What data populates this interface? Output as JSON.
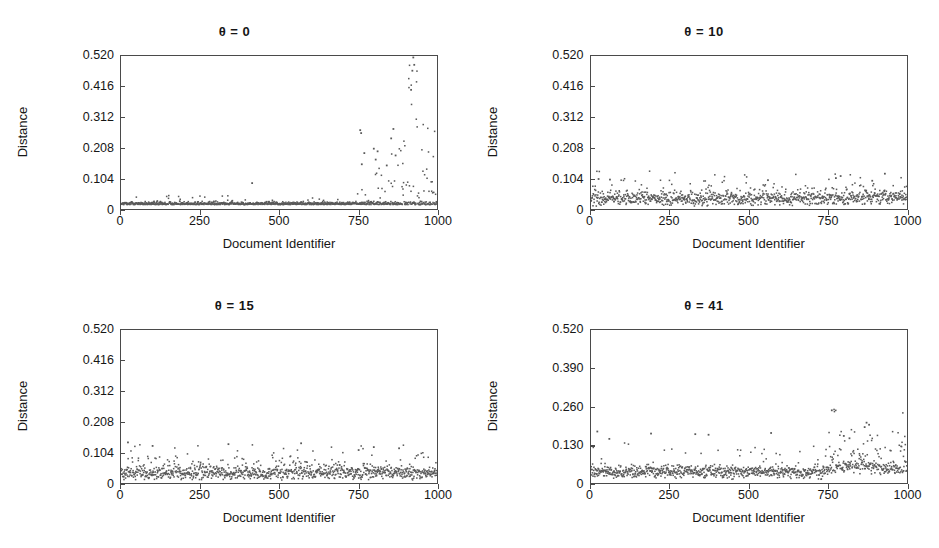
{
  "figure": {
    "background": "#ffffff",
    "point_color": "#5a5a5a",
    "axis_color": "#4a4a4a"
  },
  "chart_data": [
    {
      "type": "scatter",
      "title": "θ = 0",
      "xlabel": "Document Identifier",
      "ylabel": "Distance",
      "xlim": [
        0,
        1000
      ],
      "ylim": [
        0,
        0.52
      ],
      "xticks": [
        0,
        250,
        500,
        750,
        1000
      ],
      "xticklabels": [
        "0",
        "250",
        "500",
        "750",
        "1000"
      ],
      "yticks": [
        0,
        0.104,
        0.208,
        0.312,
        0.416,
        0.52
      ],
      "yticklabels": [
        "0",
        "0.104",
        "0.208",
        "0.312",
        "0.416",
        "0.520"
      ],
      "grid": false,
      "legend": "none",
      "n_points": 1000,
      "description": "Very tight low baseline band near 0.010-0.025 across all document identifiers, with a dramatic burst of high outliers from about x=740 to x=1000 reaching 0.52.",
      "baseline": {
        "mean": 0.015,
        "spread": 0.008
      },
      "outlier_region": {
        "start": 740,
        "end": 1000,
        "max": 0.52
      },
      "notable_outliers": [
        {
          "x": 925,
          "y": 0.515
        },
        {
          "x": 928,
          "y": 0.49
        },
        {
          "x": 922,
          "y": 0.47
        },
        {
          "x": 918,
          "y": 0.405
        },
        {
          "x": 757,
          "y": 0.268
        },
        {
          "x": 760,
          "y": 0.258
        },
        {
          "x": 862,
          "y": 0.272
        },
        {
          "x": 855,
          "y": 0.24
        },
        {
          "x": 800,
          "y": 0.205
        },
        {
          "x": 812,
          "y": 0.196
        },
        {
          "x": 770,
          "y": 0.19
        },
        {
          "x": 869,
          "y": 0.182
        },
        {
          "x": 806,
          "y": 0.168
        },
        {
          "x": 762,
          "y": 0.152
        },
        {
          "x": 841,
          "y": 0.148
        },
        {
          "x": 415,
          "y": 0.088
        }
      ]
    },
    {
      "type": "scatter",
      "title": "θ = 10",
      "xlabel": "Document Identifier",
      "ylabel": "Distance",
      "xlim": [
        0,
        1000
      ],
      "ylim": [
        0,
        0.52
      ],
      "xticks": [
        0,
        250,
        500,
        750,
        1000
      ],
      "xticklabels": [
        "0",
        "250",
        "500",
        "750",
        "1000"
      ],
      "yticks": [
        0,
        0.104,
        0.208,
        0.312,
        0.416,
        0.52
      ],
      "yticklabels": [
        "0",
        "0.104",
        "0.208",
        "0.312",
        "0.416",
        "0.520"
      ],
      "grid": false,
      "legend": "none",
      "n_points": 1000,
      "description": "Uniform noisy band occupying roughly 0.010-0.090 across the full range of document identifiers, slightly denser and taller toward the right half. No extreme outliers.",
      "baseline": {
        "mean": 0.035,
        "spread": 0.022
      },
      "outlier_region": {
        "start": 0,
        "end": 1000,
        "max": 0.115
      },
      "notable_outliers": [
        {
          "x": 930,
          "y": 0.12
        },
        {
          "x": 790,
          "y": 0.112
        },
        {
          "x": 775,
          "y": 0.105
        },
        {
          "x": 24,
          "y": 0.102
        },
        {
          "x": 60,
          "y": 0.1
        },
        {
          "x": 560,
          "y": 0.098
        },
        {
          "x": 890,
          "y": 0.096
        }
      ]
    },
    {
      "type": "scatter",
      "title": "θ = 15",
      "xlabel": "Document Identifier",
      "ylabel": "Distance",
      "xlim": [
        0,
        1000
      ],
      "ylim": [
        0,
        0.52
      ],
      "xticks": [
        0,
        250,
        500,
        750,
        1000
      ],
      "xticklabels": [
        "0",
        "250",
        "500",
        "750",
        "1000"
      ],
      "yticks": [
        0,
        0.104,
        0.208,
        0.312,
        0.416,
        0.52
      ],
      "yticklabels": [
        "0",
        "0.104",
        "0.208",
        "0.312",
        "0.416",
        "0.520"
      ],
      "grid": false,
      "legend": "none",
      "n_points": 1000,
      "description": "Uniform noisy band from roughly 0.008 to 0.085 across the whole x range with scattered spikes up to about 0.14, evenly distributed.",
      "baseline": {
        "mean": 0.034,
        "spread": 0.021
      },
      "outlier_region": {
        "start": 0,
        "end": 1000,
        "max": 0.14
      },
      "notable_outliers": [
        {
          "x": 22,
          "y": 0.138
        },
        {
          "x": 340,
          "y": 0.132
        },
        {
          "x": 570,
          "y": 0.135
        },
        {
          "x": 100,
          "y": 0.126
        },
        {
          "x": 800,
          "y": 0.122
        },
        {
          "x": 880,
          "y": 0.118
        },
        {
          "x": 752,
          "y": 0.112
        }
      ]
    },
    {
      "type": "scatter",
      "title": "θ = 41",
      "xlabel": "Document Identifier",
      "ylabel": "Distance",
      "xlim": [
        0,
        1000
      ],
      "ylim": [
        0,
        0.52
      ],
      "xticks": [
        0,
        250,
        500,
        750,
        1000
      ],
      "xticklabels": [
        "0",
        "250",
        "500",
        "750",
        "1000"
      ],
      "yticks": [
        0,
        0.13,
        0.26,
        0.39,
        0.52
      ],
      "yticklabels": [
        "0",
        "0.130",
        "0.260",
        "0.390",
        "0.520"
      ],
      "grid": false,
      "legend": "none",
      "n_points": 1000,
      "description": "Dense low band around 0.02-0.06 for x below 750 with scattered spikes to 0.17, then a clearly elevated and noisier region from x=750 to x=1000 rising to about 0.25.",
      "baseline": {
        "mean": 0.038,
        "spread": 0.02
      },
      "outlier_region": {
        "start": 750,
        "end": 1000,
        "max": 0.25
      },
      "notable_outliers": [
        {
          "x": 762,
          "y": 0.247
        },
        {
          "x": 872,
          "y": 0.205
        },
        {
          "x": 880,
          "y": 0.198
        },
        {
          "x": 866,
          "y": 0.19
        },
        {
          "x": 20,
          "y": 0.175
        },
        {
          "x": 190,
          "y": 0.168
        },
        {
          "x": 330,
          "y": 0.166
        },
        {
          "x": 372,
          "y": 0.164
        },
        {
          "x": 570,
          "y": 0.17
        },
        {
          "x": 800,
          "y": 0.16
        },
        {
          "x": 818,
          "y": 0.152
        },
        {
          "x": 58,
          "y": 0.15
        }
      ]
    }
  ]
}
